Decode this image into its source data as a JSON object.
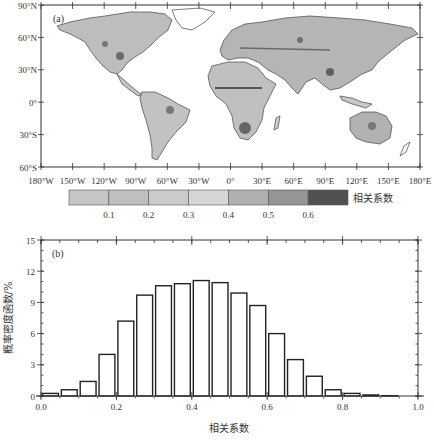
{
  "panel_a": {
    "label": "(a)",
    "lat_labels": [
      "90°N",
      "60°N",
      "30°N",
      "0°",
      "30°S",
      "60°S"
    ],
    "lon_labels": [
      "180°W",
      "150°W",
      "120°W",
      "90°W",
      "60°W",
      "30°W",
      "0°",
      "30°E",
      "60°E",
      "90°E",
      "120°E",
      "150°E",
      "180°E"
    ],
    "colorbar": {
      "title": "相关系数",
      "ticks": [
        "0.1",
        "0.2",
        "0.3",
        "0.4",
        "0.5",
        "0.6"
      ],
      "colors": [
        "#c6c6c6",
        "#bfbfbf",
        "#cbcbcb",
        "#d6d6d6",
        "#b0b0b0",
        "#959595",
        "#505050"
      ]
    }
  },
  "panel_b": {
    "label": "(b)",
    "xlabel": "相关系数",
    "ylabel": "概率密度函数/%",
    "xticks": [
      "0.0",
      "0.2",
      "0.4",
      "0.6",
      "0.8",
      "1.0"
    ],
    "yticks": [
      "0",
      "3",
      "6",
      "9",
      "12",
      "15"
    ]
  },
  "chart_data": [
    {
      "type": "heatmap",
      "title": "(a)",
      "description": "Global land map of correlation coefficient, shaded grayscale",
      "xlabel": "",
      "ylabel": "",
      "x_ticks": [
        "180°W",
        "150°W",
        "120°W",
        "90°W",
        "60°W",
        "30°W",
        "0°",
        "30°E",
        "60°E",
        "90°E",
        "120°E",
        "150°E",
        "180°E"
      ],
      "y_ticks": [
        "90°N",
        "60°N",
        "30°N",
        "0°",
        "30°S",
        "60°S"
      ],
      "xlim": [
        -180,
        180
      ],
      "ylim": [
        -60,
        90
      ],
      "colorbar_label": "相关系数",
      "colorbar_levels": [
        0.1,
        0.2,
        0.3,
        0.4,
        0.5,
        0.6
      ]
    },
    {
      "type": "bar",
      "title": "(b)",
      "xlabel": "相关系数",
      "ylabel": "概率密度函数/%",
      "xlim": [
        0.0,
        1.0
      ],
      "ylim": [
        0,
        15
      ],
      "bin_width": 0.05,
      "categories": [
        "0.00-0.05",
        "0.05-0.10",
        "0.10-0.15",
        "0.15-0.20",
        "0.20-0.25",
        "0.25-0.30",
        "0.30-0.35",
        "0.35-0.40",
        "0.40-0.45",
        "0.45-0.50",
        "0.50-0.55",
        "0.55-0.60",
        "0.60-0.65",
        "0.65-0.70",
        "0.70-0.75",
        "0.75-0.80",
        "0.80-0.85",
        "0.85-0.90",
        "0.90-0.95"
      ],
      "bin_starts": [
        0.0,
        0.05,
        0.1,
        0.15,
        0.2,
        0.25,
        0.3,
        0.35,
        0.4,
        0.45,
        0.5,
        0.55,
        0.6,
        0.65,
        0.7,
        0.75,
        0.8,
        0.85,
        0.9
      ],
      "values": [
        0.25,
        0.6,
        1.4,
        4.0,
        7.2,
        9.7,
        10.6,
        10.8,
        11.1,
        10.9,
        9.9,
        8.7,
        6.0,
        3.5,
        1.9,
        0.6,
        0.25,
        0.1,
        0.03
      ],
      "grid": false,
      "legend": null
    }
  ]
}
